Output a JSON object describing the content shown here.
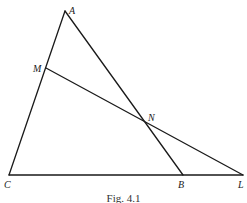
{
  "figure": {
    "caption": "Fig. 4.1",
    "points": {
      "A": {
        "label": "A",
        "x": 65,
        "y": 11
      },
      "M": {
        "label": "M",
        "x": 46,
        "y": 68
      },
      "N": {
        "label": "N",
        "x": 145,
        "y": 124
      },
      "C": {
        "label": "C",
        "x": 9,
        "y": 175
      },
      "B": {
        "label": "B",
        "x": 183,
        "y": 175
      },
      "L": {
        "label": "L",
        "x": 243,
        "y": 175
      }
    },
    "segments": [
      {
        "name": "AC",
        "from": "A",
        "to": "C"
      },
      {
        "name": "AB",
        "from": "A",
        "to": "B"
      },
      {
        "name": "CL",
        "from": "C",
        "to": "L"
      },
      {
        "name": "ML",
        "from": "M",
        "to": "L"
      }
    ],
    "colors": {
      "stroke": "#1a1a1a",
      "background": "#ffffff"
    }
  }
}
